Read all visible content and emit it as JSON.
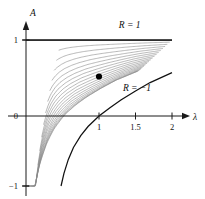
{
  "chart_data": {
    "type": "line",
    "title": "",
    "xlabel": "λ",
    "ylabel": "A",
    "xlim": [
      0,
      2.15
    ],
    "ylim": [
      -1.12,
      1.12
    ],
    "grid": false,
    "legend": "annotations",
    "xticks": [
      1,
      1.5,
      2
    ],
    "xticklabels": [
      "1",
      "1.5",
      "2"
    ],
    "yticks": [
      -1,
      0,
      1
    ],
    "yticklabels": [
      "-1",
      "0",
      "1"
    ],
    "annotations": [
      {
        "text": "R = 1",
        "x": 1.42,
        "y": 1.09,
        "name": "upper-boundary-label"
      },
      {
        "text": "R = −1",
        "x": 1.52,
        "y": 0.33,
        "name": "lower-boundary-label"
      }
    ],
    "markers": [
      {
        "x": 1.0,
        "y": 0.52,
        "name": "marked-point",
        "style": "filled-circle"
      }
    ],
    "family": {
      "param": "R",
      "param_min": -1,
      "param_max": 1,
      "count": 21,
      "description": "A(lambda) = (lambda - 1 + R) / (lambda - 1 + 1/R) style saturating family between R=-1 and R=1"
    },
    "series": [
      {
        "name": "R = 1",
        "role": "upper-boundary",
        "constant_y": 1,
        "x": [
          0.0,
          2.0
        ],
        "values": [
          1,
          1
        ]
      },
      {
        "name": "R = -1",
        "role": "lower-boundary",
        "x": [
          0.48,
          0.52,
          0.58,
          0.65,
          0.75,
          0.85,
          1.0,
          1.15,
          1.3,
          1.5,
          1.7,
          2.0
        ],
        "values": [
          -1.0,
          -0.82,
          -0.62,
          -0.45,
          -0.28,
          -0.15,
          0.0,
          0.11,
          0.21,
          0.33,
          0.44,
          0.57
        ]
      }
    ]
  },
  "figure": {
    "axis_origin_label": "0",
    "background": "#ffffff",
    "curve_color": "#8a8a8a",
    "boundary_color": "#111111",
    "axis_color": "#1a1a1a"
  }
}
